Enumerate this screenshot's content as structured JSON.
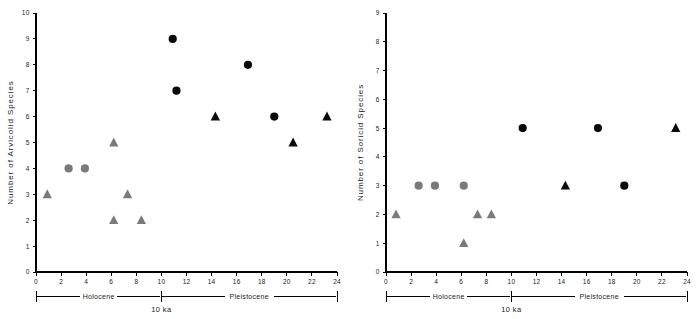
{
  "figure": {
    "background_color": "#ffffff",
    "panel_count": 2
  },
  "styles": {
    "holocene_color": "#7a7a7a",
    "pleistocene_color": "#0a0a0a",
    "axis_color": "#000000"
  },
  "chart_data": [
    {
      "type": "scatter",
      "panel": "left",
      "title": "",
      "xlabel": "",
      "ylabel": "Number of Arvicolid Species",
      "xlim": [
        0,
        24
      ],
      "ylim": [
        0,
        10
      ],
      "xticks": [
        0,
        2,
        4,
        6,
        8,
        10,
        12,
        14,
        16,
        18,
        20,
        22,
        24
      ],
      "xtick_labels": [
        "0",
        "2",
        "4",
        "6",
        "8",
        "10",
        "12",
        "14",
        "16",
        "18",
        "20",
        "22",
        "24"
      ],
      "yticks": [
        0,
        1,
        2,
        3,
        4,
        5,
        6,
        7,
        8,
        9,
        10
      ],
      "ytick_labels": [
        "0",
        "1",
        "2",
        "3",
        "4",
        "5",
        "6",
        "7",
        "8",
        "9",
        "10"
      ],
      "grid": false,
      "legend": "none",
      "annotations": {
        "left_period": "Holocene",
        "right_period": "Pleistocene",
        "boundary": "10 ka",
        "boundary_x": 10
      },
      "series": [
        {
          "name": "Holocene circle",
          "marker": "circle",
          "color": "#7a7a7a",
          "points": [
            {
              "x": 2.6,
              "y": 4
            },
            {
              "x": 3.9,
              "y": 4
            }
          ]
        },
        {
          "name": "Holocene triangle",
          "marker": "triangle",
          "color": "#7a7a7a",
          "points": [
            {
              "x": 0.9,
              "y": 3
            },
            {
              "x": 6.2,
              "y": 5
            },
            {
              "x": 6.2,
              "y": 2
            },
            {
              "x": 7.3,
              "y": 3
            },
            {
              "x": 8.4,
              "y": 2
            }
          ]
        },
        {
          "name": "Pleistocene circle",
          "marker": "circle",
          "color": "#0a0a0a",
          "points": [
            {
              "x": 10.9,
              "y": 9
            },
            {
              "x": 11.2,
              "y": 7
            },
            {
              "x": 16.9,
              "y": 8
            },
            {
              "x": 19.0,
              "y": 6
            }
          ]
        },
        {
          "name": "Pleistocene triangle",
          "marker": "triangle",
          "color": "#0a0a0a",
          "points": [
            {
              "x": 14.3,
              "y": 6
            },
            {
              "x": 20.5,
              "y": 5
            },
            {
              "x": 23.2,
              "y": 6
            }
          ]
        }
      ]
    },
    {
      "type": "scatter",
      "panel": "right",
      "title": "",
      "xlabel": "",
      "ylabel": "Number of Soricid Species",
      "xlim": [
        0,
        24
      ],
      "ylim": [
        0,
        9
      ],
      "xticks": [
        0,
        2,
        4,
        6,
        8,
        10,
        12,
        14,
        16,
        18,
        20,
        22,
        24
      ],
      "xtick_labels": [
        "0",
        "2",
        "4",
        "6",
        "8",
        "10",
        "12",
        "14",
        "16",
        "18",
        "20",
        "22",
        "24"
      ],
      "yticks": [
        0,
        1,
        2,
        3,
        4,
        5,
        6,
        7,
        8,
        9
      ],
      "ytick_labels": [
        "0",
        "1",
        "2",
        "3",
        "4",
        "5",
        "6",
        "7",
        "8",
        "9"
      ],
      "grid": false,
      "legend": "none",
      "annotations": {
        "left_period": "Holocene",
        "right_period": "Pleistocene",
        "boundary": "10 ka",
        "boundary_x": 10
      },
      "series": [
        {
          "name": "Holocene circle",
          "marker": "circle",
          "color": "#7a7a7a",
          "points": [
            {
              "x": 2.6,
              "y": 3
            },
            {
              "x": 3.9,
              "y": 3
            },
            {
              "x": 6.2,
              "y": 3
            }
          ]
        },
        {
          "name": "Holocene triangle",
          "marker": "triangle",
          "color": "#7a7a7a",
          "points": [
            {
              "x": 0.8,
              "y": 2
            },
            {
              "x": 6.2,
              "y": 1
            },
            {
              "x": 7.3,
              "y": 2
            },
            {
              "x": 8.4,
              "y": 2
            }
          ]
        },
        {
          "name": "Pleistocene circle",
          "marker": "circle",
          "color": "#0a0a0a",
          "points": [
            {
              "x": 10.9,
              "y": 5
            },
            {
              "x": 16.9,
              "y": 5
            },
            {
              "x": 19.0,
              "y": 3
            }
          ]
        },
        {
          "name": "Pleistocene triangle",
          "marker": "triangle",
          "color": "#0a0a0a",
          "points": [
            {
              "x": 14.3,
              "y": 3
            },
            {
              "x": 23.1,
              "y": 5
            }
          ]
        }
      ]
    }
  ]
}
